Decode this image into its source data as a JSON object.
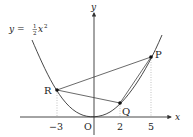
{
  "diagram": {
    "equation": {
      "prefix": "y = ",
      "frac_num": "1",
      "frac_den": "2",
      "var": "x",
      "exp": "2"
    },
    "axes": {
      "x_label": "x",
      "y_label": "y",
      "origin_label": "O"
    },
    "ticks": [
      {
        "label": "−3",
        "value": -3
      },
      {
        "label": "2",
        "value": 2
      },
      {
        "label": "5",
        "value": 5
      }
    ],
    "points": {
      "P": {
        "label": "P",
        "x": 5,
        "y": 12.5
      },
      "Q": {
        "label": "Q",
        "x": 2,
        "y": 2
      },
      "R": {
        "label": "R",
        "x": -3,
        "y": 4.5
      }
    },
    "colors": {
      "curve": "#333333",
      "axis": "#333333",
      "segment": "#444444",
      "guide": "#999999"
    }
  }
}
